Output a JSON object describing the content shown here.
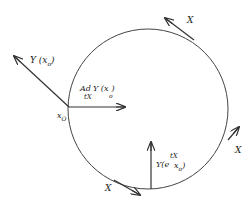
{
  "diagram": {
    "labels": {
      "y_x0": "Y (x",
      "y_x0_sub": "o",
      "y_x0_close": ")",
      "x0": "x",
      "x0_sub": "O",
      "ad_main": "Ad",
      "ad_sub": "tX",
      "ad_y": "Y (x",
      "ad_y_sub": "o",
      "ad_y_close": ")",
      "bottom_y": "Y(e",
      "bottom_sup": "tX",
      "bottom_x": "x",
      "bottom_sub": "o",
      "bottom_close": ")",
      "x_top": "X",
      "x_right": "X",
      "x_bottom": "X"
    },
    "colors": {
      "stroke": "#333333",
      "background": "#ffffff"
    }
  }
}
